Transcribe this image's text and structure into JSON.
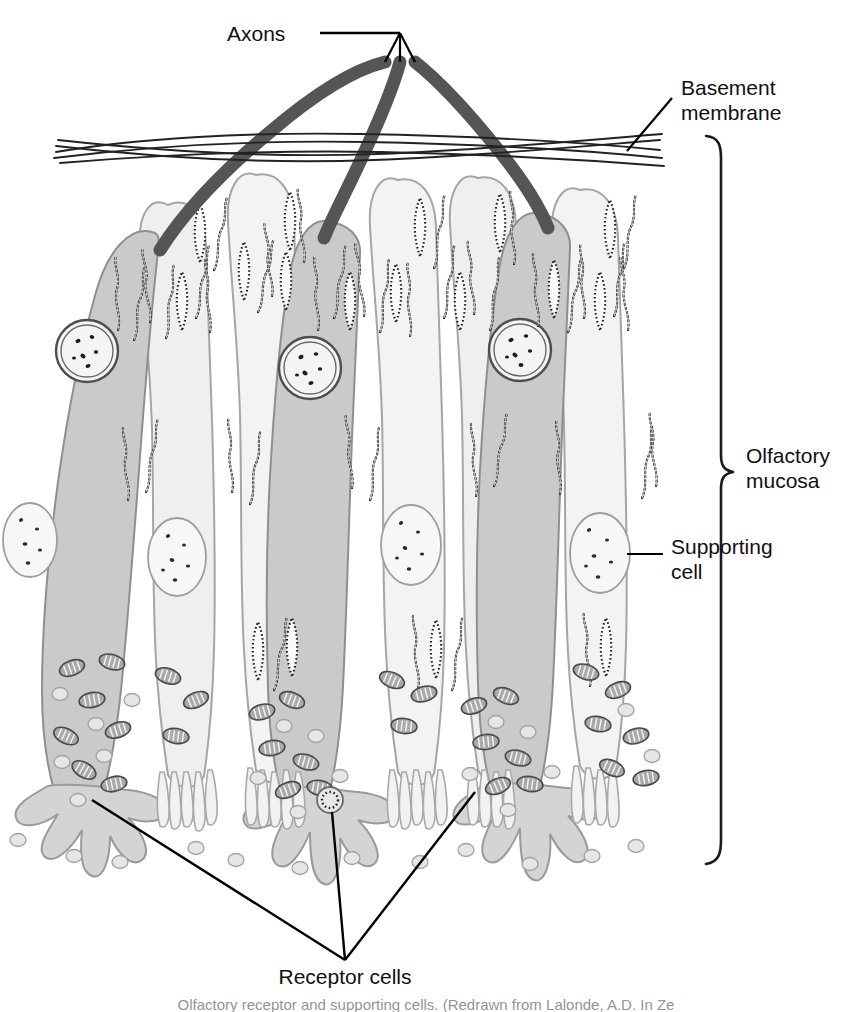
{
  "figure": {
    "type": "labeled-anatomical-illustration",
    "background_color": "#ffffff"
  },
  "labels": {
    "axons": "Axons",
    "basement_membrane_line1": "Basement",
    "basement_membrane_line2": "membrane",
    "olfactory_mucosa_line1": "Olfactory",
    "olfactory_mucosa_line2": "mucosa",
    "supporting_cell_line1": "Supporting",
    "supporting_cell_line2": "cell",
    "receptor_cells": "Receptor cells"
  },
  "caption": {
    "text": "Olfactory receptor and supporting cells. (Redrawn from Lalonde, A.D. In Ze"
  },
  "colors": {
    "outline": "#3c3c3c",
    "axon": "#5a5a5a",
    "receptor_cell_fill": "#c9c9c9",
    "supporting_cell_fill": "#efefef",
    "cell_outline": "#9a9a9a",
    "nucleus_fill": "#f4f4f4",
    "nucleus_ring": "#555555",
    "organelle_outline": "#1a1a1a",
    "mitochondria_fill": "#a8a8a8",
    "vesicle_fill": "#e2e2e2",
    "leader_line": "#000000",
    "text": "#111111"
  },
  "structures": {
    "cell_columns": [
      {
        "name": "receptor-cell-1",
        "kind": "receptor",
        "x": 95
      },
      {
        "name": "supporting-cell-1",
        "kind": "supporting",
        "x": 175
      },
      {
        "name": "supporting-cell-2",
        "kind": "supporting",
        "x": 250
      },
      {
        "name": "receptor-cell-2",
        "kind": "receptor",
        "x": 305
      },
      {
        "name": "supporting-cell-3",
        "kind": "supporting",
        "x": 385
      },
      {
        "name": "supporting-cell-4",
        "kind": "supporting",
        "x": 455
      },
      {
        "name": "receptor-cell-3",
        "kind": "receptor",
        "x": 515
      },
      {
        "name": "supporting-cell-5",
        "kind": "supporting",
        "x": 585
      }
    ],
    "axon_count": 3,
    "basement_membrane_lines": 5,
    "brace": {
      "top_y": 135,
      "bottom_y": 865,
      "x": 723
    }
  }
}
